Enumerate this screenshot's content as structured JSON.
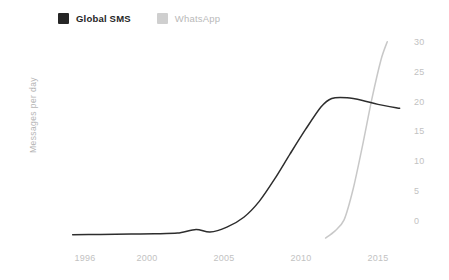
{
  "chart_data": {
    "type": "line",
    "title": "",
    "subtitle": "",
    "xlabel": "",
    "ylabel": "Messages per day",
    "xlim": [
      1995.2,
      2016.4
    ],
    "ylim": [
      0,
      30
    ],
    "grid": false,
    "legend_position": "top-left",
    "y_axis_side": "right",
    "y_ticks": [
      30,
      25,
      20,
      15,
      10,
      5,
      0
    ],
    "x_ticks": [
      1996,
      2000,
      2005,
      2010,
      2015
    ],
    "series": [
      {
        "name": "Global SMS",
        "color": "#2d2d2d",
        "points": [
          {
            "x": 1995.2,
            "y": 0.95
          },
          {
            "x": 1997.0,
            "y": 1.0
          },
          {
            "x": 1999.0,
            "y": 1.05
          },
          {
            "x": 2000.5,
            "y": 1.1
          },
          {
            "x": 2002.0,
            "y": 1.2
          },
          {
            "x": 2003.2,
            "y": 1.75
          },
          {
            "x": 2004.1,
            "y": 1.35
          },
          {
            "x": 2005.2,
            "y": 2.1
          },
          {
            "x": 2006.3,
            "y": 3.6
          },
          {
            "x": 2007.3,
            "y": 6.0
          },
          {
            "x": 2008.3,
            "y": 9.4
          },
          {
            "x": 2009.3,
            "y": 13.2
          },
          {
            "x": 2010.3,
            "y": 16.9
          },
          {
            "x": 2011.3,
            "y": 20.3
          },
          {
            "x": 2012.0,
            "y": 21.6
          },
          {
            "x": 2013.0,
            "y": 21.7
          },
          {
            "x": 2014.0,
            "y": 21.3
          },
          {
            "x": 2015.0,
            "y": 20.7
          },
          {
            "x": 2016.4,
            "y": 20.1
          }
        ]
      },
      {
        "name": "WhatsApp",
        "color": "#c8c8c8",
        "points": [
          {
            "x": 2011.6,
            "y": 0.45
          },
          {
            "x": 2012.2,
            "y": 1.5
          },
          {
            "x": 2012.8,
            "y": 3.2
          },
          {
            "x": 2013.4,
            "y": 8.0
          },
          {
            "x": 2014.0,
            "y": 14.5
          },
          {
            "x": 2014.6,
            "y": 21.5
          },
          {
            "x": 2015.2,
            "y": 27.5
          },
          {
            "x": 2015.6,
            "y": 30.2
          }
        ]
      }
    ]
  },
  "legend": {
    "items": [
      {
        "label": "Global SMS",
        "color": "#262626"
      },
      {
        "label": "WhatsApp",
        "color": "#cfcfcf"
      }
    ]
  }
}
